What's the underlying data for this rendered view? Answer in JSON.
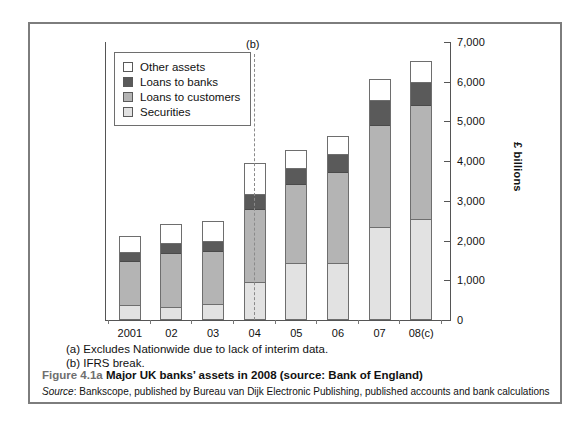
{
  "figure": {
    "number": "Figure 4.1a",
    "title": "Major UK banks’ assets in 2008 (source: Bank of England)",
    "source_keyword": "Source",
    "source_text": ": Bankscope, published by Bureau van Dijk Electronic Publishing, published accounts and bank calculations"
  },
  "footnotes": {
    "a": "(a) Excludes Nationwide due to lack of interim data.",
    "b": "(b) IFRS break."
  },
  "break_marker": {
    "label": "(b)"
  },
  "colors": {
    "other_assets": "#ffffff",
    "loans_to_banks": "#5a5a5a",
    "loans_to_customers": "#b4b4b4",
    "securities": "#e2e2e2",
    "frame": "#7d7d7d",
    "axis": "#555555"
  },
  "chart_data": {
    "type": "bar",
    "stacked": true,
    "title": "Major UK banks’ assets in 2008",
    "xlabel": "",
    "ylabel": "£ billions",
    "ylim": [
      0,
      7000
    ],
    "yticks": [
      0,
      1000,
      2000,
      3000,
      4000,
      5000,
      6000,
      7000
    ],
    "ytick_labels": [
      "0",
      "1,000",
      "2,000",
      "3,000",
      "4,000",
      "5,000",
      "6,000",
      "7,000"
    ],
    "grid": false,
    "legend_position": "top-left",
    "categories": [
      "2001",
      "02",
      "03",
      "04",
      "05",
      "06",
      "07",
      "08(c)"
    ],
    "series": [
      {
        "name": "Securities",
        "values": [
          340,
          290,
          370,
          920,
          1395,
          1395,
          2315,
          2500
        ]
      },
      {
        "name": "Loans to customers",
        "values": [
          1130,
          1370,
          1340,
          1870,
          2030,
          2320,
          2580,
          2895
        ]
      },
      {
        "name": "Loans to banks",
        "values": [
          240,
          260,
          260,
          370,
          395,
          450,
          630,
          605
        ]
      },
      {
        "name": "Other assets",
        "values": [
          395,
          500,
          530,
          790,
          450,
          475,
          550,
          526
        ]
      }
    ],
    "totals": [
      2105,
      2420,
      2500,
      3950,
      4270,
      4640,
      6075,
      6526
    ],
    "legend_order": [
      "Other assets",
      "Loans to banks",
      "Loans to customers",
      "Securities"
    ],
    "annotations": [
      {
        "text": "(b)",
        "note": "IFRS break dashed vertical line between 03 and 04"
      }
    ]
  }
}
